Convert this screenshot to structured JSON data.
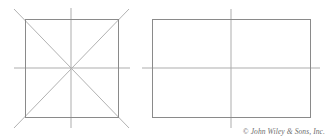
{
  "figure": {
    "background_color": "#ffffff",
    "outline_color": "#8a8a8a",
    "centerline_color": "#aaaaaa",
    "diagonal_color": "#b0b0b0",
    "shapes": [
      {
        "name": "square-with-diagonals",
        "type": "square",
        "x": 25,
        "y": 19,
        "width": 93,
        "height": 98,
        "has_diagonals": true,
        "has_centerlines": true
      },
      {
        "name": "rectangle-with-centerlines",
        "type": "rectangle",
        "x": 152,
        "y": 19,
        "width": 158,
        "height": 98,
        "has_diagonals": false,
        "has_centerlines": true
      }
    ]
  },
  "credit": {
    "text": "© John Wiley & Sons, Inc."
  }
}
